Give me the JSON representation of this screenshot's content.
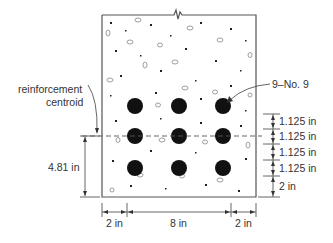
{
  "diagram": {
    "type": "reinforced concrete beam cross-section",
    "labels": {
      "centroid_line1": "reinforcement",
      "centroid_line2": "centroid",
      "bars": "9–No. 9",
      "centroid_height": "4.81 in",
      "spacing": [
        "1.125 in",
        "1.125 in",
        "1.125 in",
        "1.125 in"
      ],
      "bottom_cover": "2 in",
      "left_cover": "2 in",
      "bar_span": "8 in",
      "right_cover": "2 in"
    },
    "bars": {
      "rows": 3,
      "cols": 3,
      "x": [
        135,
        179,
        223
      ],
      "y": [
        106,
        136,
        168
      ],
      "radius": 8
    },
    "colors": {
      "line": "#555555",
      "bar": "#111111",
      "text": "#333333"
    }
  }
}
